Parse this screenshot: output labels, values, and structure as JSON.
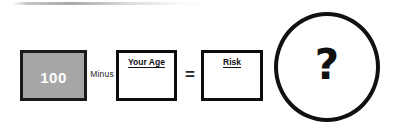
{
  "diagram": {
    "artifact": {
      "present": true
    },
    "equation": {
      "terms": [
        {
          "id": "constant-100",
          "kind": "filled-box",
          "value": "100",
          "fill_color": "#a6a6a6",
          "text_color": "#ffffff",
          "border_color": "#1a1a1a"
        },
        {
          "id": "operator-minus",
          "kind": "operator",
          "symbol": "Minus"
        },
        {
          "id": "your-age",
          "kind": "empty-box",
          "label": "Your Age",
          "value": "",
          "fill_color": "#ffffff",
          "border_color": "#0d0d0d"
        },
        {
          "id": "operator-equals",
          "kind": "operator",
          "symbol": "="
        },
        {
          "id": "risk",
          "kind": "empty-box",
          "label": "Risk",
          "value": "",
          "fill_color": "#ffffff",
          "border_color": "#0d0d0d"
        },
        {
          "id": "unknown-result",
          "kind": "circle",
          "symbol": "?",
          "border_color": "#111111",
          "fill_color": "#ffffff"
        }
      ]
    }
  }
}
